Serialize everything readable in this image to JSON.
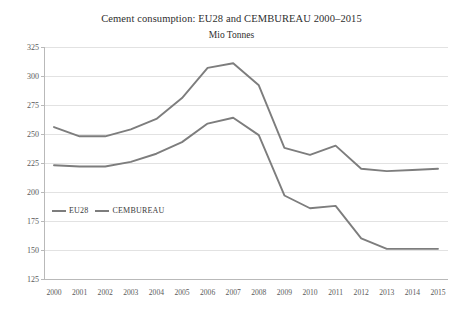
{
  "chart_data": {
    "type": "line",
    "title": "Cement consumption: EU28 and CEMBUREAU 2000–2015",
    "subtitle": "Mio Tonnes",
    "xlabel": "",
    "ylabel": "",
    "ylim": [
      125,
      325
    ],
    "ytick_step": 25,
    "grid": true,
    "legend_position": "inside-left",
    "categories": [
      "2000",
      "2001",
      "2002",
      "2003",
      "2004",
      "2005",
      "2006",
      "2007",
      "2008",
      "2009",
      "2010",
      "2011",
      "2012",
      "2013",
      "2014",
      "2015"
    ],
    "yticks": [
      "125",
      "150",
      "175",
      "200",
      "225",
      "250",
      "275",
      "300",
      "325"
    ],
    "series": [
      {
        "name": "EU28",
        "color": "#7d7d7d",
        "values": [
          223,
          222,
          222,
          226,
          233,
          243,
          259,
          264,
          249,
          197,
          186,
          188,
          160,
          151,
          151,
          151
        ]
      },
      {
        "name": "CEMBUREAU",
        "color": "#7d7d7d",
        "values": [
          256,
          248,
          248,
          254,
          263,
          281,
          307,
          311,
          292,
          238,
          232,
          240,
          220,
          218,
          219,
          220
        ]
      }
    ]
  },
  "legend": {
    "entries": [
      {
        "label": "EU28"
      },
      {
        "label": "CEMBUREAU"
      }
    ]
  },
  "colors": {
    "line": "#7d7d7d",
    "grid": "#e2e2e2",
    "axis": "#b9b9b9",
    "text": "#3a3a3a",
    "tick_text": "#5a5a5a",
    "background": "#ffffff"
  }
}
